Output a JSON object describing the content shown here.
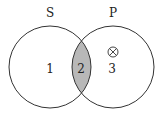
{
  "diagram": {
    "type": "venn",
    "sets": [
      {
        "id": "S",
        "label": "S"
      },
      {
        "id": "P",
        "label": "P"
      }
    ],
    "regions": [
      {
        "id": "1",
        "label": "1",
        "description": "S only",
        "shaded": false,
        "marked": false
      },
      {
        "id": "2",
        "label": "2",
        "description": "S and P",
        "shaded": true,
        "marked": false
      },
      {
        "id": "3",
        "label": "3",
        "description": "P only",
        "shaded": false,
        "marked": true,
        "mark": "⊗"
      }
    ],
    "colors": {
      "outline": "#333333",
      "shading": "#b8b8b8",
      "background": "#ffffff"
    }
  }
}
